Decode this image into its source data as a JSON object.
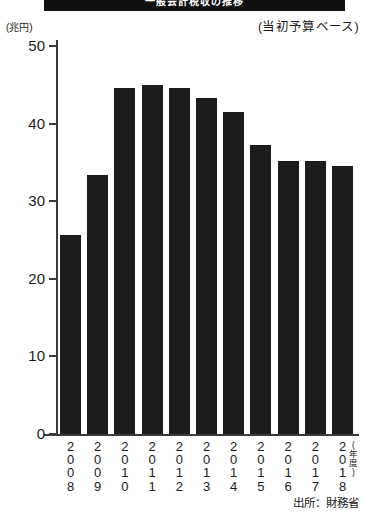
{
  "banner": {
    "title": "一般会計税収の推移"
  },
  "unit_label": "(兆円)",
  "budget_note": "(当初予算ベース)",
  "source_note": "出所：財務省",
  "nendo_label": "(年度)",
  "chart_data": {
    "type": "bar",
    "title": "一般会計税収の推移",
    "subtitle": "(当初予算ベース)",
    "xlabel": "(年度)",
    "ylabel": "(兆円)",
    "ylim": [
      0,
      50
    ],
    "yticks": [
      0,
      10,
      20,
      30,
      40,
      50
    ],
    "ytick_labels": [
      "0",
      "10",
      "20",
      "30",
      "40",
      "50"
    ],
    "grid": false,
    "legend": "none",
    "bar_color": "#1c1c1c",
    "source": "出所：財務省",
    "categories": [
      "2008",
      "2009",
      "2010",
      "2011",
      "2012",
      "2013",
      "2014",
      "2015",
      "2016",
      "2017",
      "2018"
    ],
    "values": [
      25.6,
      33.4,
      44.6,
      45.0,
      44.6,
      43.3,
      41.5,
      37.2,
      35.2,
      35.2,
      34.5
    ]
  }
}
